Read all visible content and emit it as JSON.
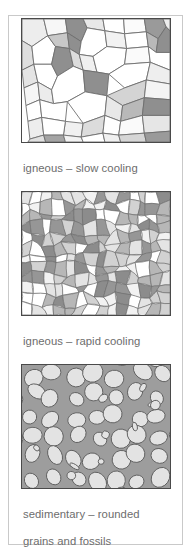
{
  "figure": {
    "border_color": "#c9c9c9",
    "background": "#ffffff",
    "caption_color": "#6d6d6d",
    "outline_color": "#4a4a4a"
  },
  "panels": [
    {
      "id": "igneous-slow-cooling",
      "texture": "large-interlocking-crystals",
      "caption_line1": "igneous – slow cooling",
      "caption_line2": "large interlocking crystals",
      "matrix_color": "#ffffff",
      "grain_palette": [
        "#ffffff",
        "#f2f2f2",
        "#e4e4e4",
        "#d2d2d2",
        "#b7b7b7",
        "#969696",
        "#8c8c8c"
      ]
    },
    {
      "id": "igneous-rapid-cooling",
      "texture": "small-interlocking-crystals",
      "caption_line1": "igneous – rapid cooling",
      "caption_line2": "small interlocking crystals",
      "matrix_color": "#ffffff",
      "grain_palette": [
        "#ffffff",
        "#f2f2f2",
        "#e4e4e4",
        "#d2d2d2",
        "#b7b7b7",
        "#969696",
        "#8c8c8c"
      ]
    },
    {
      "id": "sedimentary-rounded-grains",
      "texture": "rounded-grains-and-fossils",
      "caption_line1": "sedimentary – rounded",
      "caption_line2": "grains and fossils",
      "matrix_color": "#9d9d9d",
      "grain_palette": [
        "#e3e3e3"
      ]
    }
  ]
}
